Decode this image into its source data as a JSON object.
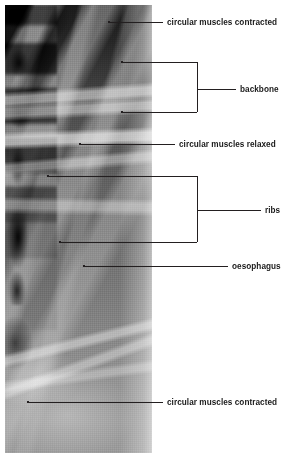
{
  "figure": {
    "kind": "annotated-radiograph",
    "image_alt": "black and white X-ray plate showing the spine, ribs and a contrast-filled oesophagus",
    "colors": {
      "background": "#ffffff",
      "leader_line": "#231f20",
      "text": "#1a1a1a",
      "plate_dark": "#141414",
      "plate_mid": "#6e6e6e",
      "plate_light": "#9c9c9c"
    }
  },
  "labels": [
    {
      "id": "circular-muscles-contracted-top",
      "text": "circular muscles contracted"
    },
    {
      "id": "backbone",
      "text": "backbone"
    },
    {
      "id": "circular-muscles-relaxed",
      "text": "circular muscles relaxed"
    },
    {
      "id": "ribs",
      "text": "ribs"
    },
    {
      "id": "oesophagus",
      "text": "oesophagus"
    },
    {
      "id": "circular-muscles-contracted-bottom",
      "text": "circular muscles contracted"
    }
  ]
}
